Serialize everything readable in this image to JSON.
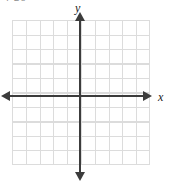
{
  "figure": {
    "kind": "cartesian-coordinate-grid",
    "width": 169,
    "height": 184,
    "background_color": "#ffffff",
    "top_fragment_text": "4     20"
  },
  "axes": {
    "x_label": "x",
    "y_label": "y",
    "line_color": "#3c3c3c",
    "arrowheads": {
      "left": "arrow-left",
      "right": "arrow-right",
      "up": "arrow-up",
      "down": "arrow-down"
    }
  },
  "grid": {
    "line_color": "#dcdcdc",
    "columns": 10,
    "rows": 10,
    "cell_width_px": 13.8,
    "cell_height_px": 14.5,
    "left_px": 12,
    "top_px": 20,
    "width_px": 138,
    "height_px": 145,
    "tick_labels": []
  },
  "chart_data": {
    "type": "scatter",
    "title": "",
    "subtitle": "",
    "xlabel": "x",
    "ylabel": "y",
    "xlim": [
      -5,
      5
    ],
    "ylim": [
      -5,
      5
    ],
    "xticks": [
      -5,
      -4,
      -3,
      -2,
      -1,
      0,
      1,
      2,
      3,
      4,
      5
    ],
    "yticks": [
      -5,
      -4,
      -3,
      -2,
      -1,
      0,
      1,
      2,
      3,
      4,
      5
    ],
    "xticklabels": [],
    "yticklabels": [],
    "grid": true,
    "legend": null,
    "series": [],
    "x": [],
    "values": [],
    "annotations": []
  }
}
